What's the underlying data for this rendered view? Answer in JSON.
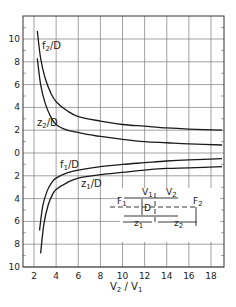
{
  "chart_data": {
    "type": "line",
    "title": "",
    "xlabel": "V2 / V1",
    "ylabel": "",
    "xlim": [
      1,
      19.2
    ],
    "ylim": [
      -10,
      12
    ],
    "y_axis_note": "Tick labels shown as absolute values; region below 0 represents negative values (f1/D, z1/D)",
    "x_ticks": [
      2,
      4,
      6,
      8,
      10,
      12,
      14,
      16,
      18
    ],
    "x_tick_labels": [
      "2",
      "4",
      "6",
      "8",
      "10",
      "12",
      "14",
      "16",
      "18"
    ],
    "y_ticks": [
      10,
      8,
      6,
      4,
      2,
      0,
      -2,
      -4,
      -6,
      -8,
      -10
    ],
    "y_tick_labels": [
      "10",
      "8",
      "6",
      "4",
      "2",
      "0",
      "2",
      "4",
      "6",
      "8",
      "10"
    ],
    "grid": true,
    "legend": "inline curve labels",
    "series": [
      {
        "name": "f2/D",
        "label_main": "f",
        "label_sub": "2",
        "label_tail": "/D",
        "x": [
          2.3,
          2.6,
          3.0,
          3.5,
          4,
          5,
          6,
          8,
          10,
          12,
          14,
          16,
          19
        ],
        "values": [
          10.7,
          8.3,
          6.6,
          5.3,
          4.5,
          3.7,
          3.2,
          2.8,
          2.5,
          2.35,
          2.2,
          2.1,
          2.0
        ]
      },
      {
        "name": "z2/D",
        "label_main": "z",
        "label_sub": "2",
        "label_tail": "/D",
        "x": [
          2.3,
          2.6,
          3.0,
          3.5,
          4,
          5,
          6,
          8,
          10,
          12,
          14,
          16,
          19
        ],
        "values": [
          8.3,
          6.0,
          4.4,
          3.2,
          2.5,
          2.0,
          1.8,
          1.45,
          1.2,
          1.0,
          0.9,
          0.8,
          0.7
        ]
      },
      {
        "name": "f1/D",
        "label_main": "f",
        "label_sub": "1",
        "label_tail": "/D",
        "x": [
          2.5,
          2.8,
          3.2,
          3.6,
          4,
          5,
          6,
          8,
          10,
          12,
          14,
          16,
          19
        ],
        "values": [
          -6.8,
          -4.6,
          -3.3,
          -2.6,
          -2.2,
          -1.75,
          -1.5,
          -1.2,
          -1.0,
          -0.85,
          -0.7,
          -0.6,
          -0.5
        ]
      },
      {
        "name": "z1/D",
        "label_main": "z",
        "label_sub": "1",
        "label_tail": "/D",
        "x": [
          2.6,
          2.9,
          3.3,
          3.7,
          4,
          5,
          6,
          8,
          10,
          12,
          14,
          16,
          19
        ],
        "values": [
          -8.8,
          -6.2,
          -4.5,
          -3.6,
          -3.2,
          -2.6,
          -2.2,
          -1.9,
          -1.7,
          -1.5,
          -1.35,
          -1.3,
          -1.2
        ]
      }
    ],
    "inset": {
      "labels": {
        "V1": "V",
        "V1_sub": "1",
        "V2": "V",
        "V2_sub": "2",
        "F1": "F",
        "F1_sub": "1",
        "F2": "F",
        "F2_sub": "2",
        "D": "D",
        "z1": "z",
        "z1_sub": "1",
        "z2": "z",
        "z2_sub": "2"
      }
    }
  },
  "axis": {
    "x_label_main": "V",
    "x_label_sub1": "2",
    "x_label_mid": " / V",
    "x_label_sub2": "1"
  }
}
